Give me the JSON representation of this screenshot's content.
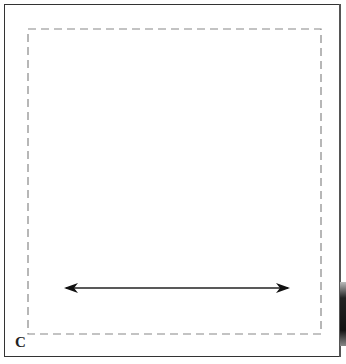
{
  "diagram": {
    "corner_label": "C",
    "colors": {
      "frame": "#333333",
      "dashed_box": "#888888",
      "arrow": "#111111",
      "background": "#ffffff"
    },
    "elements": {
      "outer_frame": "solid rectangle border",
      "inner_box": "dashed rectangle",
      "arrow": "double-headed horizontal arrow"
    }
  }
}
